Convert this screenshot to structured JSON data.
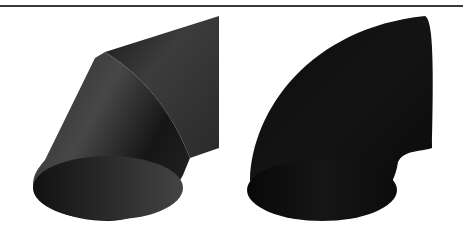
{
  "figure": {
    "rule_color": "#3a3a3a",
    "panels": [
      {
        "id": "mitered-elbow",
        "description": "Two-segment mitered pipe elbow",
        "colors": {
          "face_light": "#4a4a4a",
          "face_mid": "#3a3a3a",
          "face_dark": "#1c1c1c",
          "end_cap": "#2a2a2a"
        }
      },
      {
        "id": "smooth-elbow",
        "description": "Smooth curved 90-degree pipe elbow",
        "colors": {
          "face_light": "#1a1a1a",
          "face_dark": "#0a0a0a",
          "end_cap": "#121212"
        }
      }
    ]
  }
}
